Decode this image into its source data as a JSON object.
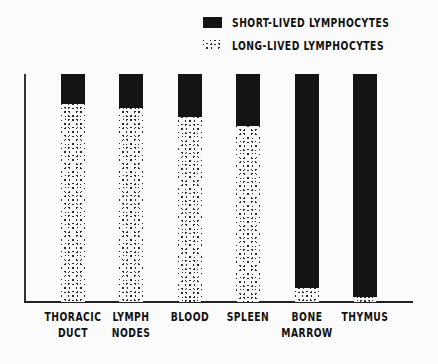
{
  "chart_data": {
    "type": "bar",
    "stacked": true,
    "orientation": "vertical",
    "title": "",
    "xlabel": "",
    "ylabel": "",
    "ylim": [
      0,
      100
    ],
    "grid": false,
    "legend_position": "top-right",
    "categories": [
      "THORACIC DUCT",
      "LYMPH NODES",
      "BLOOD",
      "SPLEEN",
      "BONE MARROW",
      "THYMUS"
    ],
    "category_lines": [
      [
        "THORACIC",
        "DUCT"
      ],
      [
        "LYMPH",
        "NODES"
      ],
      [
        "BLOOD",
        ""
      ],
      [
        "SPLEEN",
        ""
      ],
      [
        "BONE",
        "MARROW"
      ],
      [
        "THYMUS",
        ""
      ]
    ],
    "series": [
      {
        "name": "LONG-LIVED LYMPHOCYTES",
        "pattern": "crosshatch",
        "values": [
          87,
          85,
          81,
          77,
          6,
          2
        ]
      },
      {
        "name": "SHORT-LIVED LYMPHOCYTES",
        "pattern": "solid",
        "color": "#141414",
        "values": [
          13,
          15,
          19,
          23,
          94,
          98
        ]
      }
    ]
  },
  "legend": {
    "items": [
      {
        "label": "SHORT-LIVED LYMPHOCYTES",
        "pattern": "solid"
      },
      {
        "label": "LONG-LIVED LYMPHOCYTES",
        "pattern": "crosshatch"
      }
    ]
  }
}
